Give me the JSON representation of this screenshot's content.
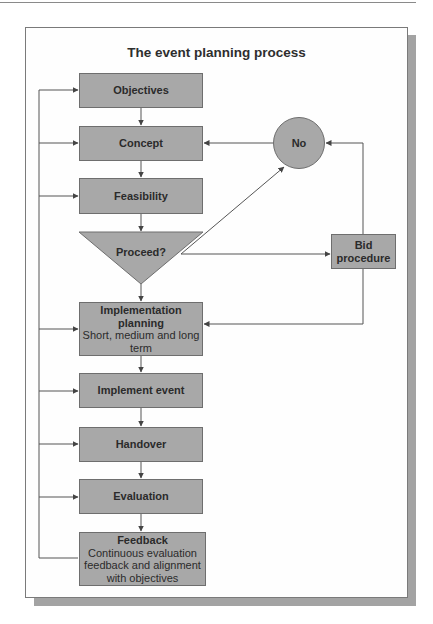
{
  "diagram": {
    "title": "The event planning process",
    "nodes": {
      "objectives": {
        "label": "Objectives",
        "shape": "rectangle"
      },
      "concept": {
        "label": "Concept",
        "shape": "rectangle"
      },
      "feasibility": {
        "label": "Feasibility",
        "shape": "rectangle"
      },
      "proceed": {
        "label": "Proceed?",
        "shape": "inverted-triangle"
      },
      "no": {
        "label": "No",
        "shape": "circle"
      },
      "bid": {
        "label_line1": "Bid",
        "label_line2": "procedure",
        "shape": "rectangle"
      },
      "implementation_planning": {
        "label_line1": "Implementation",
        "label_line2": "planning",
        "note": "Short, medium and long term",
        "shape": "rectangle"
      },
      "implement_event": {
        "label": "Implement event",
        "shape": "rectangle"
      },
      "handover": {
        "label": "Handover",
        "shape": "rectangle"
      },
      "evaluation": {
        "label": "Evaluation",
        "shape": "rectangle"
      },
      "feedback": {
        "label": "Feedback",
        "note": "Continuous evaluation feedback and alignment with objectives",
        "shape": "rectangle"
      }
    },
    "edges": [
      {
        "from": "objectives",
        "to": "concept"
      },
      {
        "from": "concept",
        "to": "feasibility"
      },
      {
        "from": "feasibility",
        "to": "proceed"
      },
      {
        "from": "proceed",
        "to": "implementation_planning"
      },
      {
        "from": "proceed",
        "to": "no"
      },
      {
        "from": "proceed",
        "to": "bid"
      },
      {
        "from": "no",
        "to": "concept"
      },
      {
        "from": "bid",
        "to": "no"
      },
      {
        "from": "bid",
        "to": "implementation_planning"
      },
      {
        "from": "implementation_planning",
        "to": "implement_event"
      },
      {
        "from": "implement_event",
        "to": "handover"
      },
      {
        "from": "handover",
        "to": "evaluation"
      },
      {
        "from": "evaluation",
        "to": "feedback"
      },
      {
        "from": "feedback",
        "to": [
          "objectives",
          "concept",
          "feasibility",
          "implementation_planning",
          "implement_event",
          "handover",
          "evaluation"
        ]
      }
    ],
    "colors": {
      "node_fill": "#a8a8a8",
      "node_border": "#6e6e6e",
      "line": "#555555",
      "shadow": "#a3a3a3"
    }
  }
}
